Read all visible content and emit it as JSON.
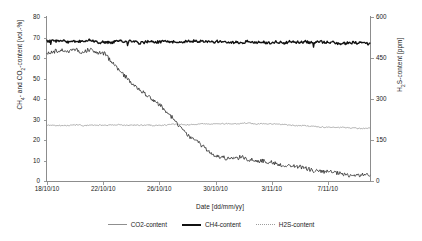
{
  "chart_data": {
    "type": "line",
    "title": "",
    "xlabel": "Date [dd/mm/yy]",
    "ylabel": "CH4- and CO2-content [vol.-%]",
    "ylabel_right": "H2S-content [ppm]",
    "grid": false,
    "legend_position": "bottom",
    "xlim": [
      0,
      23
    ],
    "ylim": [
      0,
      80
    ],
    "ylim_right": [
      0,
      600
    ],
    "xticks": [
      "18/10/10",
      "22/10/10",
      "26/10/10",
      "30/10/10",
      "3/11/10",
      "7/11/10"
    ],
    "xtick_positions": [
      0,
      4,
      8,
      12,
      16,
      20
    ],
    "yticks": [
      0,
      10,
      20,
      30,
      40,
      50,
      60,
      70,
      80
    ],
    "yticks_right": [
      0,
      150,
      300,
      450,
      600
    ],
    "x_values": [
      0,
      0.5,
      1,
      1.5,
      2,
      2.5,
      3,
      3.5,
      4,
      4.5,
      5,
      5.5,
      6,
      6.5,
      7,
      7.5,
      8,
      8.5,
      9,
      9.5,
      10,
      10.5,
      11,
      11.5,
      12,
      12.5,
      13,
      13.5,
      14,
      14.5,
      15,
      15.5,
      16,
      16.5,
      17,
      17.5,
      18,
      18.5,
      19,
      19.5,
      20,
      20.5,
      21,
      21.5,
      22,
      22.5
    ],
    "series": [
      {
        "name": "CH4-content",
        "axis": "left",
        "units": "vol.-%",
        "color": "#111111",
        "style": "solid-thick",
        "values": [
          68.2,
          67.9,
          68.4,
          67.6,
          68.1,
          67.8,
          68.3,
          67.5,
          68.0,
          67.7,
          68.2,
          67.9,
          68.5,
          67.6,
          68.1,
          67.4,
          68.0,
          67.8,
          68.3,
          67.5,
          68.1,
          67.9,
          68.4,
          67.6,
          68.0,
          67.3,
          67.9,
          67.7,
          68.2,
          67.4,
          67.8,
          67.6,
          68.1,
          67.2,
          67.7,
          67.5,
          68.0,
          67.1,
          67.6,
          67.4,
          67.9,
          67.0,
          67.5,
          67.3,
          67.8,
          67.2
        ]
      },
      {
        "name": "CO2-content",
        "axis": "left",
        "units": "vol.-%",
        "color": "#8f8f8f",
        "style": "solid-thin",
        "values": [
          27.0,
          27.2,
          26.9,
          27.1,
          27.3,
          27.0,
          27.2,
          27.4,
          27.1,
          27.3,
          27.5,
          27.2,
          27.4,
          27.1,
          27.3,
          27.0,
          27.2,
          27.4,
          27.6,
          27.3,
          27.5,
          27.8,
          28.0,
          27.7,
          27.9,
          28.1,
          27.8,
          28.0,
          28.2,
          27.9,
          28.1,
          27.8,
          27.6,
          27.4,
          27.2,
          27.0,
          26.8,
          26.6,
          26.4,
          26.3,
          26.2,
          26.1,
          26.0,
          25.9,
          25.8,
          25.7
        ]
      },
      {
        "name": "H2S-content",
        "axis": "right",
        "units": "ppm",
        "color": "#2b2b2b",
        "style": "noisy-thin",
        "values": [
          468,
          474,
          477,
          472,
          480,
          476,
          484,
          470,
          466,
          440,
          410,
          380,
          352,
          330,
          312,
          292,
          268,
          242,
          214,
          186,
          160,
          140,
          120,
          104,
          92,
          84,
          78,
          88,
          82,
          74,
          70,
          66,
          62,
          58,
          54,
          50,
          46,
          42,
          38,
          34,
          30,
          27,
          24,
          22,
          20,
          18
        ]
      }
    ],
    "legend": [
      {
        "label": "CO2-content",
        "color": "#8f8f8f",
        "style": "solid-thin"
      },
      {
        "label": "CH4-content",
        "color": "#111111",
        "style": "solid-thick"
      },
      {
        "label": "H2S-content",
        "color": "#9d9d9d",
        "style": "dotted"
      }
    ]
  }
}
